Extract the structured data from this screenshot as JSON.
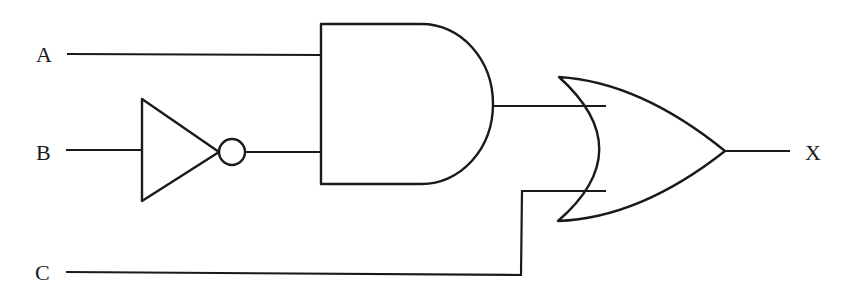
{
  "diagram": {
    "type": "logic-circuit",
    "inputs": [
      {
        "id": "A",
        "label": "A"
      },
      {
        "id": "B",
        "label": "B"
      },
      {
        "id": "C",
        "label": "C"
      }
    ],
    "output": {
      "id": "X",
      "label": "X"
    },
    "gates": [
      {
        "id": "not1",
        "type": "NOT",
        "inputs": [
          "B"
        ]
      },
      {
        "id": "and1",
        "type": "AND",
        "inputs": [
          "A",
          "not1"
        ]
      },
      {
        "id": "or1",
        "type": "OR",
        "inputs": [
          "and1",
          "C"
        ],
        "output": "X"
      }
    ],
    "expression": "X = (A · B') + C",
    "stroke_color": "#1a1a1a",
    "background_color": "#ffffff"
  }
}
